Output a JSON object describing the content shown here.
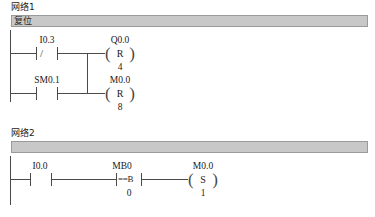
{
  "document": {
    "type": "plc-ladder-diagram",
    "background_color": "#ffffff",
    "line_color": "#4a4a4a",
    "comment_bar_color": "#c8c8c8"
  },
  "networks": [
    {
      "title": "网络1",
      "comment": "复位",
      "rungs": [
        {
          "contact": {
            "label": "I0.3",
            "kind": "normally-closed",
            "glyph": "/"
          },
          "coil": {
            "label": "Q0.0",
            "letter": "R",
            "operand": "4",
            "kind": "reset-coil"
          }
        },
        {
          "contact": {
            "label": "SM0.1",
            "kind": "normally-open",
            "glyph": ""
          },
          "coil": {
            "label": "M0.0",
            "letter": "R",
            "operand": "8",
            "kind": "reset-coil"
          }
        }
      ]
    },
    {
      "title": "网络2",
      "comment": "",
      "rungs": [
        {
          "contact": {
            "label": "I0.0",
            "kind": "normally-open",
            "glyph": ""
          },
          "compare": {
            "label": "MB0",
            "glyph": "==B",
            "operand": "0",
            "kind": "compare-byte-equal"
          },
          "coil": {
            "label": "M0.0",
            "letter": "S",
            "operand": "1",
            "kind": "set-coil"
          }
        }
      ]
    }
  ]
}
